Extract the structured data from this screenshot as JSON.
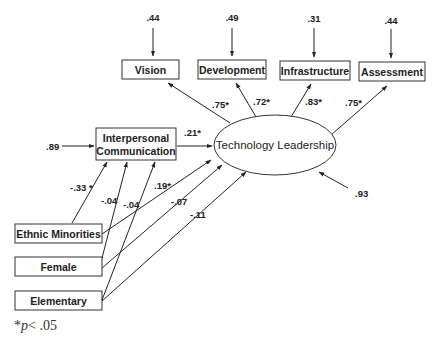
{
  "diagram": {
    "type": "path-model",
    "central_latent": {
      "label": "Technology Leadership",
      "residual": ".93"
    },
    "mediator": {
      "label_line1": "Interpersonal",
      "label_line2": "Communication",
      "residual": ".89",
      "path_to_central": ".21*"
    },
    "indicators": [
      {
        "label": "Vision",
        "loading": ".75*",
        "residual": ".44"
      },
      {
        "label": "Development",
        "loading": ".72*",
        "residual": ".49"
      },
      {
        "label": "Infrastructure",
        "loading": ".83*",
        "residual": ".31"
      },
      {
        "label": "Assessment",
        "loading": ".75*",
        "residual": ".44"
      }
    ],
    "predictors": [
      {
        "label": "Ethnic Minorities",
        "to_mediator": "-.33 *",
        "to_central": ".19*"
      },
      {
        "label": "Female",
        "to_mediator": "-.04",
        "to_central": "-.07"
      },
      {
        "label": "Elementary",
        "to_mediator": "-.04",
        "to_central": "-.11"
      }
    ],
    "note": {
      "star": "*",
      "p": "p",
      "rest": "< .05"
    }
  }
}
